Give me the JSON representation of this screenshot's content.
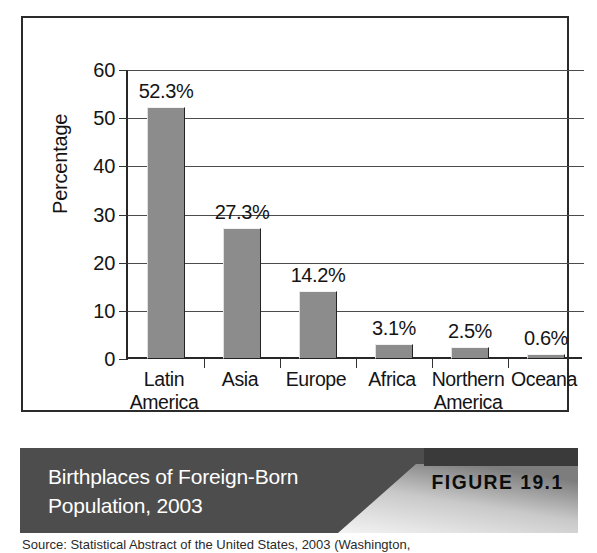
{
  "figure": {
    "caption": "Birthplaces of Foreign-Born Population, 2003",
    "number_label": "FIGURE 19.1",
    "source": "Source: Statistical Abstract of the United States, 2003 (Washington,"
  },
  "chart_data": {
    "type": "bar",
    "title": "",
    "xlabel": "",
    "ylabel": "Percentage",
    "categories": [
      "Latin America",
      "Asia",
      "Europe",
      "Africa",
      "Northern America",
      "Oceana"
    ],
    "values": [
      52.3,
      27.3,
      14.2,
      3.1,
      2.5,
      0.6
    ],
    "data_labels": [
      "52.3%",
      "27.3%",
      "14.2%",
      "3.1%",
      "2.5%",
      "0.6%"
    ],
    "ylim": [
      0,
      60
    ],
    "yticks": [
      0,
      10,
      20,
      30,
      40,
      50,
      60
    ],
    "ytick_labels": [
      "0",
      "10",
      "20",
      "30",
      "40",
      "50",
      "60"
    ],
    "grid": true,
    "legend": "none",
    "bar_color": "#8c8c8c",
    "bar_border_color": "#232323"
  },
  "colors": {
    "frame": "#2b2b2b",
    "banner_bg": "#4d4d4d",
    "banner_text": "#ffffff",
    "figure_tab": "#3a3a3a",
    "axis": "#272727"
  }
}
